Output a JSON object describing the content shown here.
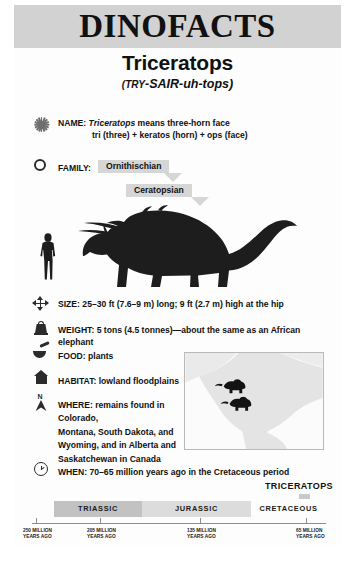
{
  "header": {
    "title": "DINOFACTS"
  },
  "species": {
    "name": "Triceratops",
    "pronunciation_prefix": "(",
    "pronunciation_try": "TRY",
    "pronunciation_rest": "-SAIR-uh-tops)"
  },
  "facts": {
    "name": {
      "icon": "starburst-icon",
      "label": "NAME:",
      "value_italic": "Triceratops",
      "value_rest": " means three-horn face",
      "line2": "tri (three) + keratos (horn) + ops (face)"
    },
    "family": {
      "icon": "circle-icon",
      "label": "FAMILY:",
      "level1": "Ornithischian",
      "level2": "Ceratopsian"
    },
    "size": {
      "icon": "four-way-arrow-icon",
      "label": "SIZE:",
      "value": "25–30 ft (7.6–9 m) long; 9 ft (2.7 m) high at the hip"
    },
    "weight": {
      "icon": "weight-icon",
      "label": "WEIGHT:",
      "value": "5 tons (4.5 tonnes)—about the same as an African elephant"
    },
    "food": {
      "icon": "mortar-bowl-icon",
      "label": "FOOD:",
      "value": "plants"
    },
    "habitat": {
      "icon": "house-icon",
      "label": "HABITAT:",
      "value": "lowland floodplains"
    },
    "where": {
      "icon": "compass-north-icon",
      "icon_letter": "N",
      "label": "WHERE:",
      "line1": "remains found in Colorado,",
      "line2": "Montana, South Dakota, and",
      "line3": "Wyoming, and in Alberta and",
      "line4": "Saskatchewan in Canada"
    },
    "when": {
      "icon": "clock-icon",
      "label": "WHEN:",
      "value": "70–65 million years ago in the Cretaceous period"
    }
  },
  "illustration": {
    "dinosaur_silhouette": "triceratops-silhouette",
    "human_silhouette": "human-scale-silhouette"
  },
  "map": {
    "name": "north-america-range-map",
    "markers": [
      "dinosaur-marker",
      "dinosaur-marker"
    ]
  },
  "timeline": {
    "highlight_label": "TRICERATOPS",
    "periods": [
      {
        "label": "TRIASSIC",
        "fill": "#c2c2c2"
      },
      {
        "label": "JURASSIC",
        "fill": "#dcdcdc"
      },
      {
        "label": "CRETACEOUS",
        "fill": "transparent"
      }
    ],
    "dates": [
      "250 MILLION\nYEARS AGO",
      "205 MILLION\nYEARS AGO",
      "135 MILLION\nYEARS AGO",
      "65 MILLION\nYEARS AGO"
    ]
  },
  "colors": {
    "header_band": "#d2d2d2",
    "arrow_box": "#d6d6d6",
    "triassic": "#c2c2c2",
    "jurassic": "#dcdcdc",
    "ink": "#111111"
  }
}
